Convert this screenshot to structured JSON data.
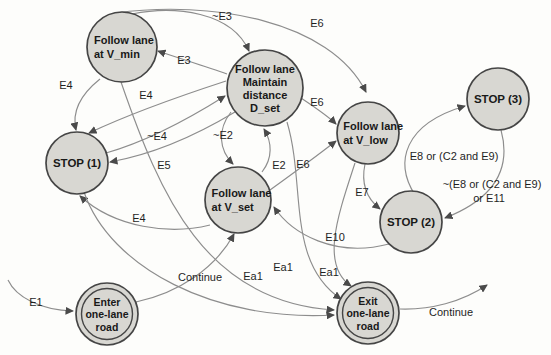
{
  "diagram": {
    "colors": {
      "background": "#fdfdfb",
      "node_fill": "#d8d7d2",
      "node_stroke": "#454545",
      "edge_line": "#8d8d8d",
      "arrowhead": "#4a4a4a",
      "label_text": "#1f1f1f",
      "node_text": "#191919"
    },
    "nodes": [
      {
        "id": "v_min",
        "label": "Follow lane at V_min",
        "lines": [
          "Follow lane",
          "at V_min"
        ],
        "kind": "state"
      },
      {
        "id": "d_set",
        "label": "Follow lane Maintain distance D_set",
        "lines": [
          "Follow lane",
          "Maintain",
          "distance",
          "D_set"
        ],
        "kind": "state"
      },
      {
        "id": "stop1",
        "label": "STOP (1)",
        "lines": [
          "STOP (1)"
        ],
        "kind": "state"
      },
      {
        "id": "v_set",
        "label": "Follow lane at V_set",
        "lines": [
          "Follow lane",
          "at V_set"
        ],
        "kind": "state"
      },
      {
        "id": "v_low",
        "label": "Follow lane at V_low",
        "lines": [
          "Follow lane",
          "at V_low"
        ],
        "kind": "state"
      },
      {
        "id": "stop3",
        "label": "STOP (3)",
        "lines": [
          "STOP (3)"
        ],
        "kind": "state"
      },
      {
        "id": "stop2",
        "label": "STOP (2)",
        "lines": [
          "STOP (2)"
        ],
        "kind": "state"
      },
      {
        "id": "enter",
        "label": "Enter one-lane road",
        "lines": [
          "Enter",
          "one-lane",
          "road"
        ],
        "kind": "double-state"
      },
      {
        "id": "exit",
        "label": "Exit one-lane road",
        "lines": [
          "Exit",
          "one-lane",
          "road"
        ],
        "kind": "double-state"
      }
    ],
    "edges": [
      {
        "id": "tilde_e3",
        "from": "v_min",
        "to": "d_set",
        "label": "~E3"
      },
      {
        "id": "e6_top",
        "from": "v_min",
        "to": "v_low",
        "label": "E6"
      },
      {
        "id": "e3",
        "from": "d_set",
        "to": "v_min",
        "label": "E3"
      },
      {
        "id": "e4_vmin",
        "from": "v_min",
        "to": "stop1",
        "label": "E4"
      },
      {
        "id": "e4_dset",
        "from": "d_set",
        "to": "stop1",
        "label": "E4"
      },
      {
        "id": "tilde_e4",
        "from": "stop1",
        "to": "d_set",
        "label": "~E4"
      },
      {
        "id": "e5",
        "from": "d_set",
        "to": "stop1",
        "label": "E5"
      },
      {
        "id": "tilde_e2",
        "from": "d_set",
        "to": "v_set",
        "label": "~E2"
      },
      {
        "id": "e2",
        "from": "v_set",
        "to": "d_set",
        "label": "E2"
      },
      {
        "id": "e6_dset",
        "from": "d_set",
        "to": "v_low",
        "label": "E6"
      },
      {
        "id": "e6_vset",
        "from": "v_set",
        "to": "v_low",
        "label": "E6"
      },
      {
        "id": "e7",
        "from": "v_low",
        "to": "stop2",
        "label": "E7"
      },
      {
        "id": "e8",
        "from": "stop2",
        "to": "stop3",
        "label": "E8 or (C2 and E9)"
      },
      {
        "id": "not_e8",
        "from": "stop3",
        "to": "stop2",
        "label": "~(E8 or (C2 and E9)",
        "label2": "or E11"
      },
      {
        "id": "e10",
        "from": "stop2",
        "to": "v_set",
        "label": "E10"
      },
      {
        "id": "e1",
        "from": "start",
        "to": "enter",
        "label": "E1"
      },
      {
        "id": "continue_enter",
        "from": "enter",
        "to": "v_set",
        "label": "Continue"
      },
      {
        "id": "continue_exit",
        "from": "exit",
        "to": "end",
        "label": "Continue"
      },
      {
        "id": "e4_vset",
        "from": "v_set",
        "to": "stop1",
        "label": "E4"
      },
      {
        "id": "ea1_vmin",
        "from": "v_min",
        "to": "exit",
        "label": "Ea1"
      },
      {
        "id": "ea1_dset",
        "from": "d_set",
        "to": "exit",
        "label": "Ea1"
      },
      {
        "id": "ea1_vlow",
        "from": "v_low",
        "to": "exit",
        "label": "Ea1"
      },
      {
        "id": "ea1_stop1",
        "from": "stop1",
        "to": "exit",
        "label": ""
      }
    ]
  }
}
